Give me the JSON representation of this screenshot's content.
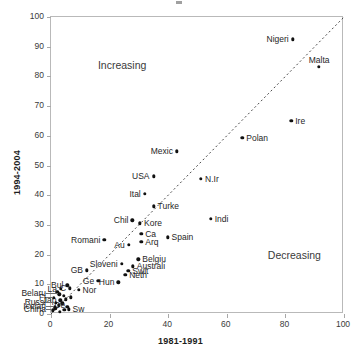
{
  "chart_data": {
    "type": "scatter",
    "title": "",
    "xlabel": "1981-1991",
    "ylabel": "1994-2004",
    "xlim": [
      0,
      100
    ],
    "ylim": [
      0,
      100
    ],
    "xticks": [
      0,
      20,
      40,
      60,
      80,
      100
    ],
    "yticks": [
      0,
      10,
      20,
      30,
      40,
      50,
      60,
      70,
      80,
      90,
      100
    ],
    "grid": false,
    "legend": "none",
    "reference_line": {
      "type": "identity",
      "style": "dotted",
      "from": [
        0,
        0
      ],
      "to": [
        100,
        100
      ]
    },
    "annotations": [
      {
        "text": "Increasing",
        "x": 16,
        "y": 86
      },
      {
        "text": "Decreasing",
        "x": 74,
        "y": 22
      }
    ],
    "points": [
      {
        "label": "Nigeri",
        "x": 82.5,
        "y": 92.5,
        "anchor": "right"
      },
      {
        "label": "Malta",
        "x": 91.5,
        "y": 83.2,
        "anchor": "mid"
      },
      {
        "label": "Ire",
        "x": 82.0,
        "y": 65.0,
        "anchor": "left"
      },
      {
        "label": "Polan",
        "x": 65.3,
        "y": 59.4,
        "anchor": "left"
      },
      {
        "label": "Mexic",
        "x": 43.0,
        "y": 54.8,
        "anchor": "right"
      },
      {
        "label": "USA",
        "x": 35.0,
        "y": 46.4,
        "anchor": "right"
      },
      {
        "label": "N.Ir",
        "x": 51.2,
        "y": 45.5,
        "anchor": "left"
      },
      {
        "label": "Ital",
        "x": 32.0,
        "y": 40.5,
        "anchor": "right"
      },
      {
        "label": "Turke",
        "x": 35.0,
        "y": 36.2,
        "anchor": "left"
      },
      {
        "label": "Indi",
        "x": 54.5,
        "y": 32.1,
        "anchor": "left"
      },
      {
        "label": "Chil",
        "x": 27.8,
        "y": 31.6,
        "anchor": "right"
      },
      {
        "label": "Kore",
        "x": 30.4,
        "y": 30.5,
        "anchor": "left"
      },
      {
        "label": "Ca",
        "x": 30.8,
        "y": 27.1,
        "anchor": "left"
      },
      {
        "label": "Spain",
        "x": 39.8,
        "y": 25.8,
        "anchor": "left"
      },
      {
        "label": "Romani",
        "x": 18.2,
        "y": 25.0,
        "anchor": "right"
      },
      {
        "label": "Arq",
        "x": 30.8,
        "y": 24.3,
        "anchor": "left"
      },
      {
        "label": "Au",
        "x": 26.5,
        "y": 23.2,
        "anchor": "right"
      },
      {
        "label": "Belgiu",
        "x": 29.8,
        "y": 18.4,
        "anchor": "left"
      },
      {
        "label": "Sloveni",
        "x": 24.1,
        "y": 17.0,
        "anchor": "right"
      },
      {
        "label": "Australi",
        "x": 27.9,
        "y": 16.0,
        "anchor": "left"
      },
      {
        "label": "Swit",
        "x": 26.4,
        "y": 14.6,
        "anchor": "left"
      },
      {
        "label": "GB",
        "x": 12.3,
        "y": 14.7,
        "anchor": "right"
      },
      {
        "label": "Neth",
        "x": 25.3,
        "y": 13.2,
        "anchor": "left"
      },
      {
        "label": "Ge",
        "x": 16.1,
        "y": 11.2,
        "anchor": "right"
      },
      {
        "label": "Hun",
        "x": 23.0,
        "y": 10.7,
        "anchor": "right"
      },
      {
        "label": "Bul",
        "x": 5.6,
        "y": 9.6,
        "anchor": "right"
      },
      {
        "label": "C",
        "x": 6.5,
        "y": 8.6,
        "anchor": "right"
      },
      {
        "label": "La",
        "x": 3.4,
        "y": 8.4,
        "anchor": "right"
      },
      {
        "label": "Nor",
        "x": 9.4,
        "y": 8.2,
        "anchor": "left"
      },
      {
        "label": "Belaru",
        "x": 2.8,
        "y": 6.6,
        "anchor": "outside"
      },
      {
        "label": "Jap",
        "x": 3.2,
        "y": 4.6,
        "anchor": "right"
      },
      {
        "label": "Sw",
        "x": 6.0,
        "y": 1.6,
        "anchor": "left"
      },
      {
        "label": "De",
        "x": 3.0,
        "y": 0.8,
        "anchor": "mid"
      },
      {
        "label": "Fi",
        "x": 1.0,
        "y": 5.4,
        "anchor": "outside"
      },
      {
        "label": "Russi",
        "x": 1.6,
        "y": 3.8,
        "anchor": "outside"
      },
      {
        "label": "Icelan",
        "x": 1.2,
        "y": 2.4,
        "anchor": "outside"
      },
      {
        "label": "China",
        "x": 0.6,
        "y": 1.2,
        "anchor": "outside"
      }
    ],
    "extra_markers": [
      {
        "x": 2.2,
        "y": 7.3
      },
      {
        "x": 4.3,
        "y": 6.1
      },
      {
        "x": 5.0,
        "y": 4.9
      },
      {
        "x": 3.9,
        "y": 3.6
      },
      {
        "x": 2.6,
        "y": 2.9
      },
      {
        "x": 5.6,
        "y": 2.4
      },
      {
        "x": 1.5,
        "y": 1.9
      },
      {
        "x": 4.6,
        "y": 1.5
      },
      {
        "x": 6.8,
        "y": 5.6
      }
    ]
  }
}
